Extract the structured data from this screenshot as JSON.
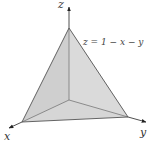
{
  "diagram": {
    "type": "3d-plane-tetrahedron",
    "axes": {
      "x_label": "x",
      "y_label": "y",
      "z_label": "z"
    },
    "plane_label": "z = 1 − x − y",
    "colors": {
      "face_fill": "#d6d6d6",
      "edge": "#555555",
      "axis": "#222222",
      "background": "#ffffff"
    }
  }
}
